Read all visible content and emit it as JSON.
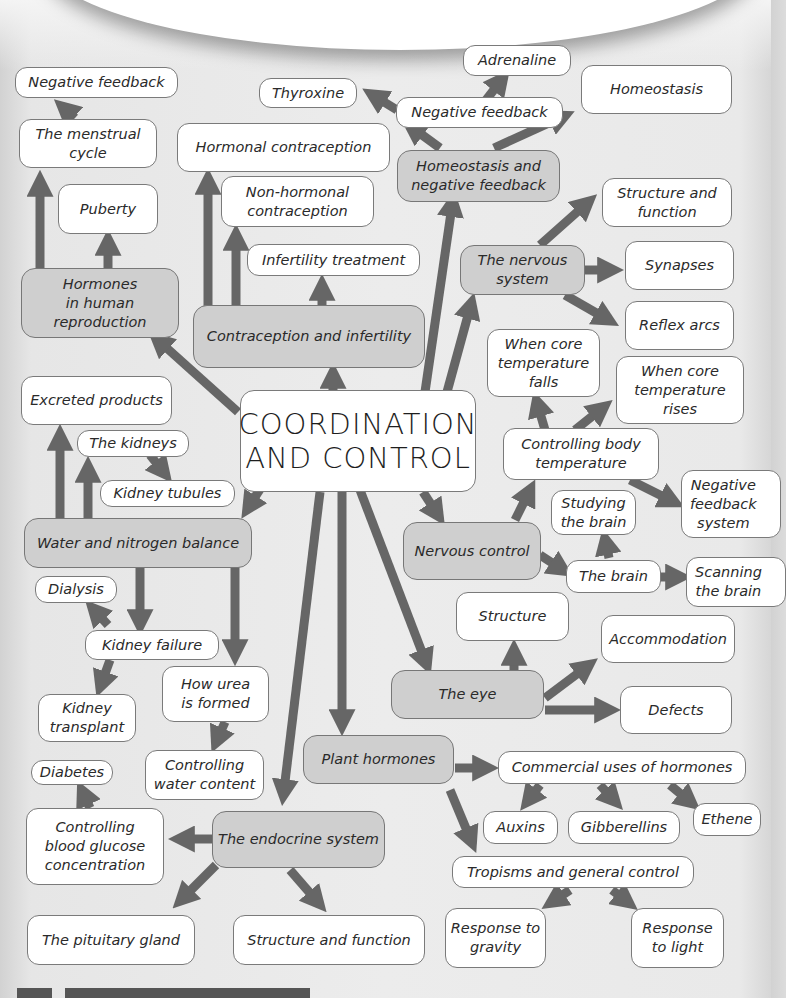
{
  "title": "COORDINATION\nAND CONTROL",
  "colors": {
    "background": "#eaeaea",
    "topic_box": "#cfcfcf",
    "subtopic_box": "#ffffff",
    "arrow": "#666666",
    "border": "#7a7a7a"
  },
  "topics": {
    "hormones_reproduction": {
      "label": "Hormones\nin human\nreproduction",
      "children": {
        "menstrual_cycle": "The menstrual\ncycle",
        "negative_feedback": "Negative feedback",
        "puberty": "Puberty"
      }
    },
    "contraception": {
      "label": "Contraception and infertility",
      "children": {
        "hormonal": "Hormonal contraception",
        "non_hormonal": "Non-hormonal\ncontraception",
        "infertility_treatment": "Infertility treatment"
      }
    },
    "homeostasis": {
      "label": "Homeostasis and\nnegative feedback",
      "children": {
        "negative_feedback": "Negative feedback",
        "adrenaline": "Adrenaline",
        "thyroxine": "Thyroxine",
        "homeostasis": "Homeostasis"
      }
    },
    "nervous_system": {
      "label": "The nervous\nsystem",
      "children": {
        "structure_function": "Structure and\nfunction",
        "synapses": "Synapses",
        "reflex_arcs": "Reflex arcs"
      }
    },
    "body_temperature": {
      "label": "Controlling body\ntemperature",
      "children": {
        "falls": "When core\ntemperature\nfalls",
        "rises": "When core\ntemperature\nrises",
        "negative_feedback_system": "Negative\nfeedback\nsystem"
      }
    },
    "nervous_control": {
      "label": "Nervous control",
      "children": {
        "the_brain": "The brain",
        "studying_brain": "Studying\nthe brain",
        "scanning_brain": "Scanning\nthe brain"
      }
    },
    "water_nitrogen": {
      "label": "Water and nitrogen balance",
      "children": {
        "excreted_products": "Excreted products",
        "kidneys": "The kidneys",
        "kidney_tubules": "Kidney tubules",
        "kidney_failure": "Kidney failure",
        "dialysis": "Dialysis",
        "kidney_transplant": "Kidney\ntransplant",
        "how_urea": "How urea\nis formed",
        "water_content": "Controlling\nwater content"
      }
    },
    "eye": {
      "label": "The eye",
      "children": {
        "structure": "Structure",
        "accommodation": "Accommodation",
        "defects": "Defects"
      }
    },
    "plant_hormones": {
      "label": "Plant hormones",
      "children": {
        "commercial_uses": "Commercial uses of hormones",
        "auxins": "Auxins",
        "gibberellins": "Gibberellins",
        "ethene": "Ethene",
        "tropisms": "Tropisms and general control",
        "gravity": "Response to\ngravity",
        "light": "Response\nto light"
      }
    },
    "endocrine": {
      "label": "The endocrine system",
      "children": {
        "blood_glucose": "Controlling\nblood glucose\nconcentration",
        "diabetes": "Diabetes",
        "pituitary": "The pituitary gland",
        "structure_function": "Structure and function"
      }
    }
  }
}
